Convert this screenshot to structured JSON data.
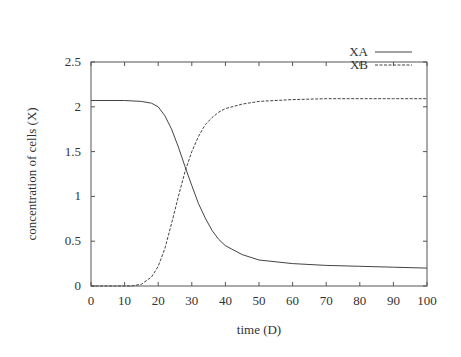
{
  "chart_data": {
    "type": "line",
    "title": "",
    "xlabel": "time (D)",
    "ylabel": "concentration of cells (X)",
    "xlim": [
      0,
      100
    ],
    "ylim": [
      0,
      2.5
    ],
    "xticks": [
      0,
      10,
      20,
      30,
      40,
      50,
      60,
      70,
      80,
      90,
      100
    ],
    "yticks": [
      0,
      0.5,
      1,
      1.5,
      2,
      2.5
    ],
    "ytick_labels": [
      "0",
      "0.5",
      "1",
      "1.5",
      "2",
      "2.5"
    ],
    "grid": false,
    "legend_position": "top-right",
    "series": [
      {
        "name": "XA",
        "style": "solid",
        "x": [
          0,
          10,
          15,
          18,
          20,
          22,
          24,
          26,
          28,
          30,
          32,
          34,
          36,
          38,
          40,
          45,
          50,
          60,
          70,
          80,
          90,
          100
        ],
        "y": [
          2.07,
          2.07,
          2.06,
          2.04,
          2.0,
          1.9,
          1.75,
          1.55,
          1.33,
          1.12,
          0.92,
          0.76,
          0.62,
          0.52,
          0.45,
          0.35,
          0.29,
          0.25,
          0.23,
          0.22,
          0.21,
          0.2
        ]
      },
      {
        "name": "XB",
        "style": "dashed",
        "x": [
          0,
          10,
          12,
          15,
          18,
          20,
          22,
          24,
          26,
          28,
          30,
          32,
          34,
          36,
          38,
          40,
          45,
          50,
          60,
          70,
          80,
          90,
          100
        ],
        "y": [
          0,
          0,
          0.0,
          0.02,
          0.1,
          0.22,
          0.42,
          0.7,
          1.0,
          1.28,
          1.5,
          1.67,
          1.8,
          1.88,
          1.94,
          1.98,
          2.03,
          2.06,
          2.08,
          2.09,
          2.09,
          2.09,
          2.09
        ]
      }
    ]
  }
}
